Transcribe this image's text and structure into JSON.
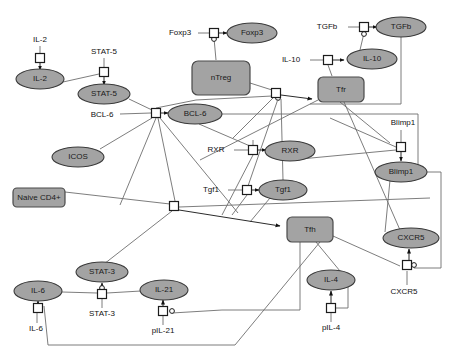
{
  "diagram": {
    "colors": {
      "node_fill": "#a3a3a3",
      "node_stroke": "#3a3a3a",
      "edge": "#6e6e6e",
      "edge_dark": "#2b2b2b",
      "square_fill": "#ffffff",
      "background": "#ffffff",
      "text": "#111111"
    },
    "species_nodes": [
      {
        "id": "il2",
        "label": "IL-2",
        "shape": "ellipse",
        "cx": 40,
        "cy": 79,
        "rx": 24,
        "ry": 10
      },
      {
        "id": "stat5",
        "label": "STAT-5",
        "shape": "ellipse",
        "cx": 104,
        "cy": 94,
        "rx": 26,
        "ry": 10
      },
      {
        "id": "bcl6",
        "label": "BCL-6",
        "shape": "ellipse",
        "cx": 195,
        "cy": 114,
        "rx": 27,
        "ry": 10
      },
      {
        "id": "icos",
        "label": "ICOS",
        "shape": "ellipse",
        "cx": 78,
        "cy": 157,
        "rx": 26,
        "ry": 10
      },
      {
        "id": "foxp3",
        "label": "Foxp3",
        "shape": "ellipse",
        "cx": 252,
        "cy": 33,
        "rx": 25,
        "ry": 10
      },
      {
        "id": "tgfb",
        "label": "TGFb",
        "shape": "ellipse",
        "cx": 401,
        "cy": 27,
        "rx": 25,
        "ry": 10
      },
      {
        "id": "il10",
        "label": "IL-10",
        "shape": "ellipse",
        "cx": 372,
        "cy": 59,
        "rx": 25,
        "ry": 10
      },
      {
        "id": "rxr",
        "label": "RXR",
        "shape": "ellipse",
        "cx": 290,
        "cy": 151,
        "rx": 25,
        "ry": 10
      },
      {
        "id": "blimp1",
        "label": "Blimp1",
        "shape": "ellipse",
        "cx": 401,
        "cy": 172,
        "rx": 26,
        "ry": 10
      },
      {
        "id": "tgf1",
        "label": "Tgf1",
        "shape": "ellipse",
        "cx": 283,
        "cy": 190,
        "rx": 24,
        "ry": 10
      },
      {
        "id": "cxcr5",
        "label": "CXCR5",
        "shape": "ellipse",
        "cx": 411,
        "cy": 238,
        "rx": 28,
        "ry": 10
      },
      {
        "id": "stat3",
        "label": "STAT-3",
        "shape": "ellipse",
        "cx": 102,
        "cy": 272,
        "rx": 26,
        "ry": 10
      },
      {
        "id": "il6",
        "label": "IL-6",
        "shape": "ellipse",
        "cx": 38,
        "cy": 291,
        "rx": 24,
        "ry": 10
      },
      {
        "id": "il21",
        "label": "IL-21",
        "shape": "ellipse",
        "cx": 164,
        "cy": 290,
        "rx": 24,
        "ry": 10
      },
      {
        "id": "il4",
        "label": "IL-4",
        "shape": "ellipse",
        "cx": 331,
        "cy": 280,
        "rx": 24,
        "ry": 10
      }
    ],
    "compartment_nodes": [
      {
        "id": "ntreg",
        "label": "nTreg",
        "shape": "rounded-rect",
        "x": 192,
        "y": 61,
        "w": 58,
        "h": 34
      },
      {
        "id": "tfr",
        "label": "Tfr",
        "shape": "rounded-rect",
        "x": 318,
        "y": 77,
        "w": 46,
        "h": 25
      },
      {
        "id": "naive_cd4",
        "label": "Naive CD4+",
        "shape": "rounded-rect",
        "x": 13,
        "y": 188,
        "w": 52,
        "h": 19
      },
      {
        "id": "tfh",
        "label": "Tfh",
        "shape": "rounded-rect",
        "x": 287,
        "y": 217,
        "w": 46,
        "h": 25
      }
    ],
    "reaction_squares": [
      {
        "id": "r_il2",
        "x": 40,
        "y": 58
      },
      {
        "id": "r_stat5",
        "x": 104,
        "y": 72
      },
      {
        "id": "r_bcl6",
        "x": 156,
        "y": 113
      },
      {
        "id": "r_foxp3",
        "x": 214,
        "y": 33
      },
      {
        "id": "r_tgfb",
        "x": 364,
        "y": 27
      },
      {
        "id": "r_il10",
        "x": 328,
        "y": 60
      },
      {
        "id": "r_ntreg_out",
        "x": 276,
        "y": 93
      },
      {
        "id": "r_rxr",
        "x": 253,
        "y": 150
      },
      {
        "id": "r_blimp1",
        "x": 401,
        "y": 147
      },
      {
        "id": "r_tgf1",
        "x": 247,
        "y": 190
      },
      {
        "id": "r_tfh_in",
        "x": 174,
        "y": 206
      },
      {
        "id": "r_cxcr5",
        "x": 407,
        "y": 265
      },
      {
        "id": "r_stat3",
        "x": 102,
        "y": 294
      },
      {
        "id": "r_il6",
        "x": 38,
        "y": 308
      },
      {
        "id": "r_il21",
        "x": 163,
        "y": 311
      },
      {
        "id": "r_il4",
        "x": 331,
        "y": 308
      }
    ],
    "free_labels": [
      {
        "id": "lbl_il2",
        "text": "IL-2",
        "x": 40,
        "y": 40
      },
      {
        "id": "lbl_stat5",
        "text": "STAT-5",
        "x": 104,
        "y": 52
      },
      {
        "id": "lbl_bcl6",
        "text": "BCL-6",
        "x": 102,
        "y": 115
      },
      {
        "id": "lbl_foxp3",
        "text": "Foxp3",
        "x": 180,
        "y": 33
      },
      {
        "id": "lbl_tgfb",
        "text": "TGFb",
        "x": 327,
        "y": 27
      },
      {
        "id": "lbl_il10",
        "text": "IL-10",
        "x": 291,
        "y": 60
      },
      {
        "id": "lbl_rxr",
        "text": "RXR",
        "x": 216,
        "y": 150
      },
      {
        "id": "lbl_blimp1",
        "text": "Blimp1",
        "x": 403,
        "y": 123
      },
      {
        "id": "lbl_tgf1",
        "text": "Tgf1",
        "x": 211,
        "y": 190
      },
      {
        "id": "lbl_cxcr5",
        "text": "CXCR5",
        "x": 404,
        "y": 292
      },
      {
        "id": "lbl_stat3",
        "text": "STAT-3",
        "x": 102,
        "y": 314
      },
      {
        "id": "lbl_il6",
        "text": "IL-6",
        "x": 36,
        "y": 329
      },
      {
        "id": "lbl_pil21",
        "text": "pIL-21",
        "x": 163,
        "y": 331
      },
      {
        "id": "lbl_pil4",
        "text": "pIL-4",
        "x": 331,
        "y": 328
      }
    ]
  }
}
